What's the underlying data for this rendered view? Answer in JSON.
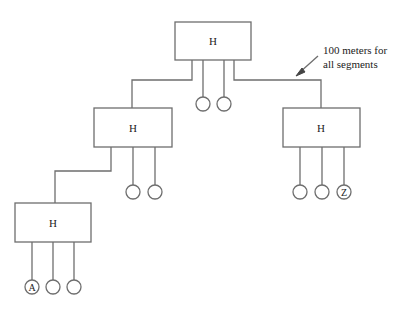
{
  "diagram": {
    "type": "hub-tree-topology",
    "line_color": "#6e6e6e",
    "text_color": "#222222",
    "annotation": {
      "line1": "100 meters for",
      "line2": "all segments"
    },
    "hubs": [
      {
        "id": "top",
        "label": "H"
      },
      {
        "id": "middle-left",
        "label": "H"
      },
      {
        "id": "middle-right",
        "label": "H"
      },
      {
        "id": "bottom-left",
        "label": "H"
      }
    ],
    "stations": {
      "A": "A",
      "Z": "Z"
    }
  }
}
